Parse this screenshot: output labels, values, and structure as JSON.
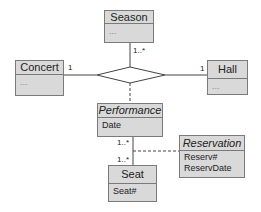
{
  "diagram": {
    "type": "UML class diagram (ternary association with association class)",
    "classes": {
      "season": {
        "name": "Season",
        "attributes": [
          "..."
        ]
      },
      "concert": {
        "name": "Concert",
        "attributes": [
          "..."
        ]
      },
      "hall": {
        "name": "Hall",
        "attributes": [
          "..."
        ]
      },
      "performance": {
        "name": "Performance",
        "attributes": [
          "Date"
        ],
        "italic": true
      },
      "seat": {
        "name": "Seat",
        "attributes": [
          "Seat#"
        ]
      },
      "reservation": {
        "name": "Reservation",
        "attributes": [
          "Reserv#",
          "ReservDate"
        ],
        "italic": true
      }
    },
    "multiplicities": {
      "season": "1..*",
      "concert": "1",
      "hall": "1",
      "performance_seat_top": "1..*",
      "performance_seat_bottom": "1..*"
    },
    "colors": {
      "box_fill": "#d9d9d9",
      "border": "#7a7a7a",
      "line": "#444444"
    }
  }
}
